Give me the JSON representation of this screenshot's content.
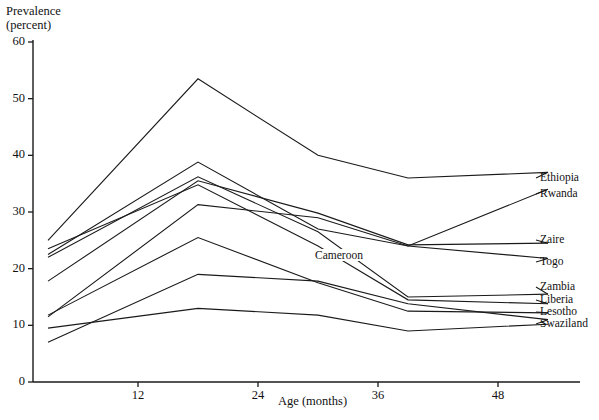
{
  "chart_data": {
    "type": "line",
    "title": "",
    "ylabel": "Prevalence\n(percent)",
    "ylabel_line1": "Prevalence",
    "ylabel_line2": "(percent)",
    "xlabel": "Age (months)",
    "xlim": [
      0,
      56
    ],
    "ylim": [
      0,
      60
    ],
    "xticks": [
      12,
      24,
      36,
      48
    ],
    "yticks": [
      0,
      10,
      20,
      30,
      40,
      50,
      60
    ],
    "grid": false,
    "legend_position": "right-inline-labels",
    "annotations": [
      {
        "text": "Cameroon",
        "x": 32.5,
        "y": 22.0
      }
    ],
    "series": [
      {
        "name": "Ethiopia",
        "x": [
          3,
          18,
          30,
          39,
          53
        ],
        "y": [
          25.0,
          53.5,
          40.0,
          36.0,
          37.0
        ]
      },
      {
        "name": "Rwanda",
        "x": [
          3,
          18,
          30,
          39,
          53
        ],
        "y": [
          22.5,
          38.8,
          27.0,
          24.0,
          34.0
        ]
      },
      {
        "name": "Zaire",
        "x": [
          3,
          18,
          30,
          39,
          53
        ],
        "y": [
          17.8,
          35.5,
          29.8,
          24.2,
          24.5
        ]
      },
      {
        "name": "Togo",
        "x": [
          3,
          18,
          30,
          39,
          53
        ],
        "y": [
          11.5,
          31.3,
          29.0,
          24.0,
          21.8
        ]
      },
      {
        "name": "Zambia",
        "x": [
          3,
          18,
          30,
          39,
          53
        ],
        "y": [
          22.0,
          36.2,
          26.5,
          15.0,
          15.5
        ]
      },
      {
        "name": "Liberia",
        "x": [
          3,
          18,
          30,
          39,
          53
        ],
        "y": [
          23.5,
          34.8,
          24.0,
          14.5,
          13.8
        ]
      },
      {
        "name": "Lesotho",
        "x": [
          3,
          18,
          30,
          39,
          53
        ],
        "y": [
          11.8,
          25.5,
          17.5,
          12.5,
          12.2
        ]
      },
      {
        "name": "Swaziland",
        "x": [
          3,
          18,
          30,
          39,
          53
        ],
        "y": [
          7.0,
          19.0,
          17.8,
          13.8,
          11.0
        ]
      },
      {
        "name": "Cameroon",
        "x": [
          3,
          18,
          30,
          39,
          53
        ],
        "y": [
          9.5,
          13.0,
          11.8,
          9.0,
          10.2
        ]
      }
    ],
    "series_labels": [
      {
        "name": "Ethiopia",
        "label": "Ethiopia"
      },
      {
        "name": "Rwanda",
        "label": "Rwanda"
      },
      {
        "name": "Zaire",
        "label": "Zaire"
      },
      {
        "name": "Togo",
        "label": "Togo"
      },
      {
        "name": "Zambia",
        "label": "Zambia"
      },
      {
        "name": "Liberia",
        "label": "Liberia"
      },
      {
        "name": "Lesotho",
        "label": "Lesotho"
      },
      {
        "name": "Swaziland",
        "label": "Swaziland"
      }
    ],
    "line_color": "#1a1a1a",
    "axis_color": "#1a1a1a"
  }
}
